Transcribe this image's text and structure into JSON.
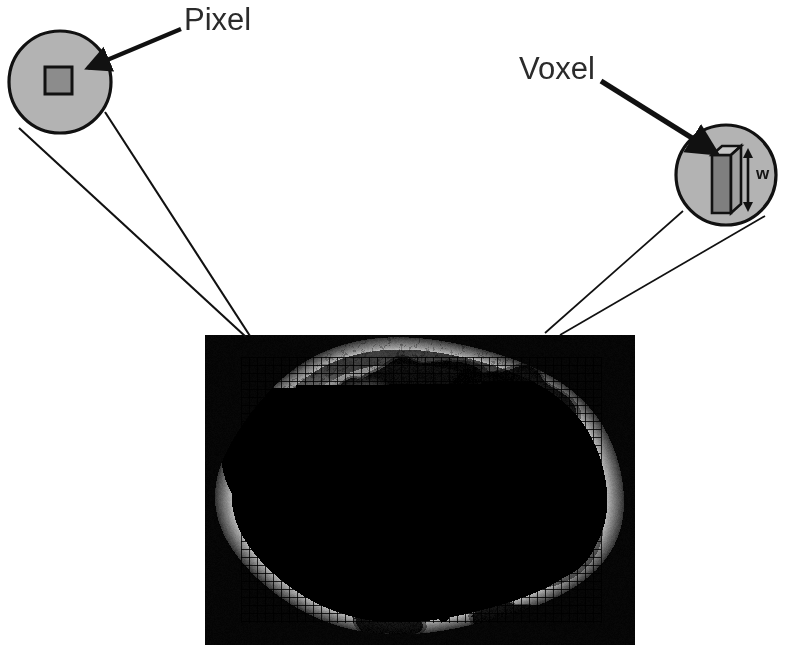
{
  "figure": {
    "background_color": "#ffffff"
  },
  "callouts": [
    {
      "id": "pixel",
      "label": "Pixel",
      "label_position": {
        "x": 184,
        "y": 4
      },
      "circle": {
        "cx": 60,
        "cy": 82,
        "r": 52
      },
      "circle_fill": "#b3b3b3",
      "circle_stroke": "#111111",
      "inner_shape": "square",
      "inner_fill": "#8c8c8c",
      "inner_stroke": "#111111",
      "inner_rect": {
        "x": 44,
        "y": 66,
        "w": 28,
        "h": 28
      },
      "arrow_from": {
        "x": 180,
        "y": 30
      },
      "arrow_to": {
        "x": 84,
        "y": 70
      },
      "leader_target": {
        "x": 246,
        "y": 336
      }
    },
    {
      "id": "voxel",
      "label": "Voxel",
      "label_position": {
        "x": 519,
        "y": 53
      },
      "circle": {
        "cx": 726,
        "cy": 175,
        "r": 50
      },
      "circle_fill": "#b3b3b3",
      "circle_stroke": "#111111",
      "inner_shape": "box-3d",
      "box_front_fill": "#7a7a7a",
      "box_top_fill": "#c9c9c9",
      "box_side_fill": "#9a9a9a",
      "box_stroke": "#111111",
      "dimension_label": "w",
      "dimension_label_position": {
        "x": 756,
        "y": 165
      },
      "arrow_from": {
        "x": 602,
        "y": 82
      },
      "arrow_to": {
        "x": 713,
        "y": 152
      },
      "leader_target": {
        "x": 546,
        "y": 335
      }
    }
  ],
  "ct_image": {
    "name": "axial-abdominal-ct",
    "frame": {
      "x": 205,
      "y": 335,
      "width": 430,
      "height": 310
    },
    "background_color": "#000000",
    "grid": {
      "visible": true,
      "cell_size_px": 8,
      "line_color": "rgba(0,0,0,0.82)",
      "line_width": 1,
      "region": {
        "x": 36,
        "y": 22,
        "width": 360,
        "height": 266
      }
    },
    "anatomy": {
      "body_outline": {
        "cx": 214,
        "cy": 152,
        "rx": 196,
        "ry": 142
      },
      "subcutaneous_fat_ring": true,
      "structures": [
        {
          "name": "liver",
          "cx": 118,
          "cy": 120,
          "rx": 88,
          "ry": 74,
          "level": 0.52
        },
        {
          "name": "right-kidney",
          "cx": 143,
          "cy": 172,
          "rx": 52,
          "ry": 48,
          "level": 0.66
        },
        {
          "name": "left-kidney",
          "cx": 330,
          "cy": 192,
          "rx": 52,
          "ry": 46,
          "level": 0.66
        },
        {
          "name": "vertebral-body",
          "cx": 240,
          "cy": 180,
          "rx": 48,
          "ry": 40,
          "level": 0.95
        },
        {
          "name": "spinous-process",
          "cx": 238,
          "cy": 248,
          "rx": 9,
          "ry": 30,
          "level": 0.93
        },
        {
          "name": "aorta",
          "cx": 258,
          "cy": 105,
          "rx": 26,
          "ry": 24,
          "level": 0.92
        },
        {
          "name": "bowel-gas-anterior",
          "cx": 205,
          "cy": 45,
          "rx": 62,
          "ry": 20,
          "level": 0.02
        },
        {
          "name": "bowel-gas-left",
          "cx": 322,
          "cy": 58,
          "rx": 46,
          "ry": 22,
          "level": 0.02
        },
        {
          "name": "psoas-right",
          "cx": 196,
          "cy": 215,
          "rx": 26,
          "ry": 24,
          "level": 0.48
        },
        {
          "name": "psoas-left",
          "cx": 292,
          "cy": 218,
          "rx": 26,
          "ry": 24,
          "level": 0.48
        }
      ]
    }
  },
  "colors": {
    "magnifier_fill": "#b3b3b3",
    "stroke": "#111111",
    "text": "#2b2b2b",
    "pixel_fill": "#8c8c8c",
    "image_background": "#000000"
  }
}
